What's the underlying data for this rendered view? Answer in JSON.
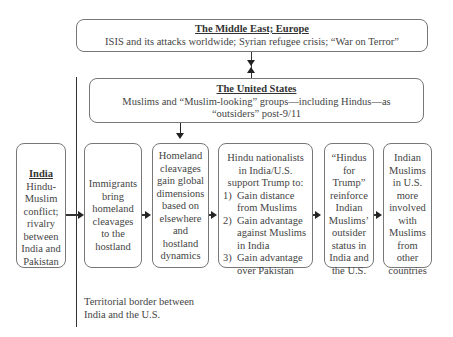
{
  "middle_east": {
    "title": "The Middle East; Europe",
    "text": "ISIS and its attacks worldwide; Syrian refugee crisis; “War on Terror”"
  },
  "us": {
    "title": "The United States",
    "text_line1": "Muslims and “Muslim-looking” groups—including Hindus—as",
    "text_line2": "“outsiders” post-9/11"
  },
  "boxes": [
    {
      "title": "India",
      "lines": [
        "Hindu-",
        "Muslim",
        "conflict;",
        "rivalry",
        "between",
        "India and",
        "Pakistan"
      ]
    },
    {
      "lines": [
        "Immigrants",
        "bring",
        "homeland",
        "cleavages",
        "to the",
        "hostland"
      ]
    },
    {
      "lines": [
        "Homeland",
        "cleavages",
        "gain global",
        "dimensions",
        "based on",
        "elsewhere",
        "and",
        "hostland",
        "dynamics"
      ]
    },
    {
      "intro": [
        "Hindu nationalists",
        "in India/U.S.",
        "support Trump to:"
      ],
      "items": [
        {
          "num": "1)",
          "l1": "Gain distance",
          "l2": "from Muslims"
        },
        {
          "num": "2)",
          "l1": "Gain advantage",
          "l2": "against Muslims",
          "l3": "in India"
        },
        {
          "num": "3)",
          "l1": "Gain advantage",
          "l2": "over Pakistan"
        }
      ]
    },
    {
      "lines": [
        "“Hindus",
        "for",
        "Trump”",
        "reinforce",
        "Indian",
        "Muslims’",
        "outsider",
        "status in",
        "India and",
        "the U.S."
      ]
    },
    {
      "lines": [
        "Indian",
        "Muslims",
        "in U.S.",
        "more",
        "involved",
        "with",
        "Muslims",
        "from",
        "other",
        "countries"
      ]
    }
  ],
  "border_note": {
    "line1": "Territorial border between",
    "line2": "India and the U.S."
  }
}
